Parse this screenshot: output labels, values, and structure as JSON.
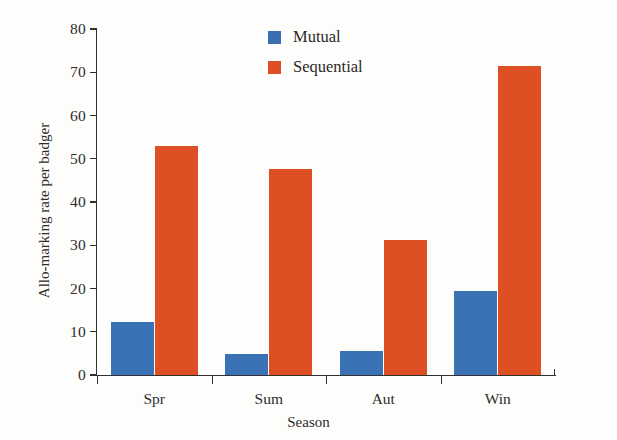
{
  "chart_data": {
    "type": "bar",
    "title": "",
    "xlabel": "Season",
    "ylabel": "Allo-marking rate per badger",
    "categories": [
      "Spr",
      "Sum",
      "Aut",
      "Win"
    ],
    "series": [
      {
        "name": "Mutual",
        "color": "#3a72b5",
        "values": [
          12.2,
          4.9,
          5.6,
          19.4
        ]
      },
      {
        "name": "Sequential",
        "color": "#de5024",
        "values": [
          52.9,
          47.6,
          31.2,
          71.5
        ]
      }
    ],
    "ylim": [
      0,
      80
    ],
    "yticks": [
      0,
      10,
      20,
      30,
      40,
      50,
      60,
      70,
      80
    ],
    "ytick_labels": [
      "0",
      "10",
      "20",
      "30",
      "40",
      "50",
      "60",
      "70",
      "80"
    ],
    "grid": false,
    "legend_position": "top-center"
  },
  "legend": {
    "entries": [
      {
        "label": "Mutual",
        "swatch": "mutual-swatch"
      },
      {
        "label": "Sequential",
        "swatch": "sequential-swatch"
      }
    ]
  },
  "axes": {
    "y_title": "Allo-marking rate per badger",
    "x_title": "Season"
  }
}
